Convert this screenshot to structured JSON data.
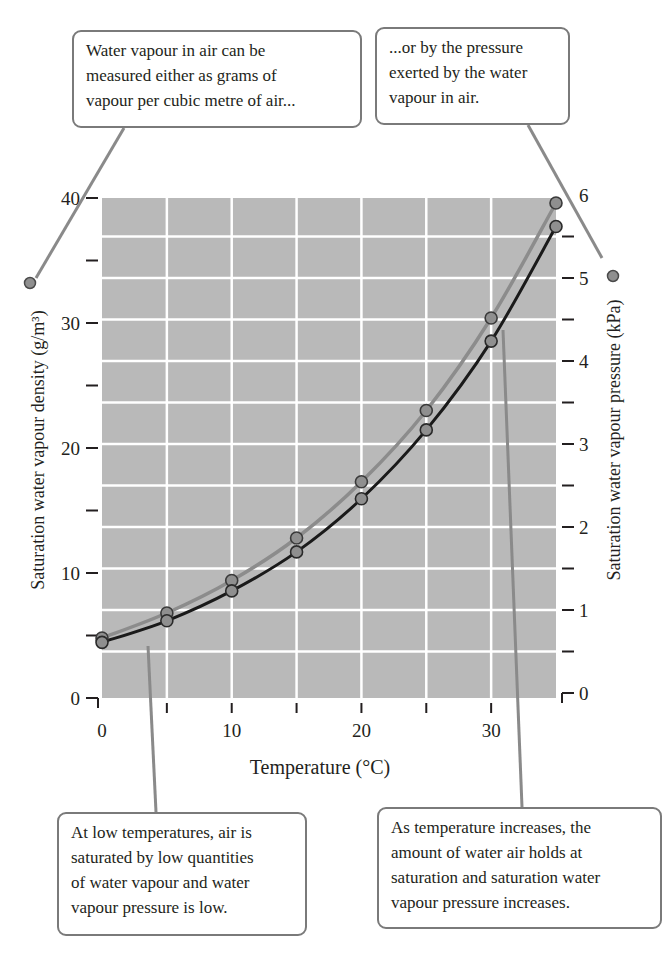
{
  "callouts": {
    "top_left": {
      "lines": [
        "Water vapour in air can be",
        "measured either as grams of",
        "vapour per cubic metre of air..."
      ]
    },
    "top_right": {
      "lines": [
        "...or by the pressure",
        "exerted by the water",
        "vapour in air."
      ]
    },
    "bottom_left": {
      "lines": [
        "At low temperatures, air is",
        "saturated by low quantities",
        "of water vapour and water",
        "vapour pressure is low."
      ]
    },
    "bottom_right": {
      "lines": [
        "As temperature increases, the",
        "amount of water air holds at",
        "saturation and saturation water",
        "vapour pressure increases."
      ]
    }
  },
  "axes": {
    "x_title": "Temperature (°C)",
    "y_left_title": "Saturation water vapour density (g/m³)",
    "y_right_title": "Saturation water vapour pressure (kPa)",
    "x_ticks": [
      "0",
      "10",
      "20",
      "30"
    ],
    "y_left_ticks": [
      "0",
      "10",
      "20",
      "30",
      "40"
    ],
    "y_right_ticks": [
      "0",
      "1",
      "2",
      "3",
      "4",
      "5",
      "6"
    ]
  },
  "colors": {
    "plot_bg": "#b9b9b9",
    "grid": "#ffffff",
    "density_line": "#8c8c8c",
    "pressure_line": "#1a1a1a",
    "marker_fill": "#8f8f8f",
    "callout_border": "#7a7a7a"
  },
  "chart_data": {
    "type": "line",
    "title": "",
    "xlabel": "Temperature (°C)",
    "ylabel": "Saturation water vapour density (g/m³)",
    "y2label": "Saturation water vapour pressure (kPa)",
    "x": [
      0,
      5,
      10,
      15,
      20,
      25,
      30,
      35
    ],
    "xlim": [
      0,
      35
    ],
    "ylim": [
      0,
      40
    ],
    "y2lim": [
      0,
      6
    ],
    "grid": true,
    "series": [
      {
        "name": "Saturation water vapour density (g/m³)",
        "axis": "left",
        "color": "gray",
        "values": [
          4.8,
          6.8,
          9.4,
          12.8,
          17.3,
          23.0,
          30.4,
          39.6
        ]
      },
      {
        "name": "Saturation water vapour pressure (kPa)",
        "axis": "right",
        "color": "black",
        "values": [
          0.61,
          0.87,
          1.23,
          1.7,
          2.34,
          3.17,
          4.24,
          5.62
        ]
      }
    ]
  }
}
